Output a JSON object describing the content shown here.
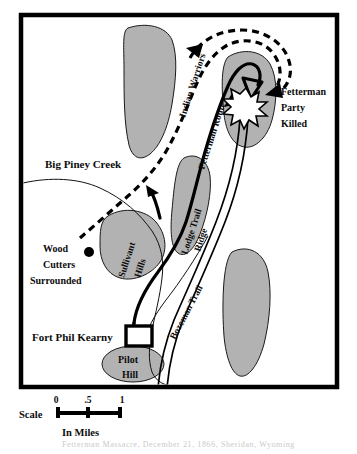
{
  "map": {
    "title": "Fetterman Fight map",
    "frame": {
      "color": "#000000"
    },
    "colors": {
      "hill_fill": "#b2b2b2",
      "hill_stroke": "#1a1a1a",
      "route_stroke": "#000000",
      "background": "#ffffff"
    },
    "labels": {
      "big_piney_creek": "Big Piney Creek",
      "indian_warriors": "Indian Warriors",
      "fetterman_route": "Fetterman Route",
      "fetterman_party_killed_line1": "Fetterman",
      "fetterman_party_killed_line2": "Party",
      "fetterman_party_killed_line3": "Killed",
      "lodge_trail": "Lodge Trail",
      "ridge": "Ridge",
      "sullivant": "Sullivant",
      "hills": "Hills",
      "wood_line1": "Wood",
      "wood_line2": "Cutters",
      "wood_line3": "Surrounded",
      "bozeman_trail": "Bozeman Trail",
      "fort_phil_kearny": "Fort Phil Kearny",
      "pilot": "Pilot",
      "hill": "Hill"
    },
    "scale": {
      "label": "Scale",
      "units": "In Miles",
      "ticks": [
        "0",
        ".5",
        "1"
      ]
    },
    "caption": "Fetterman Massacre, December 21, 1866, Sheridan, Wyoming"
  }
}
